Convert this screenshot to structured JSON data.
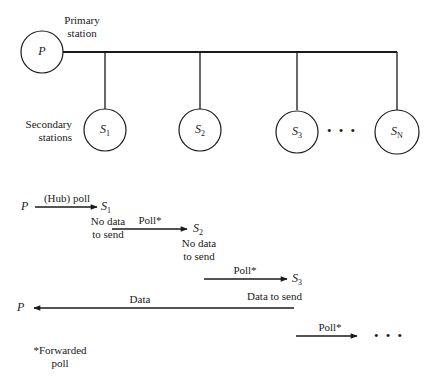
{
  "topology": {
    "primary": {
      "label": "P",
      "caption_line1": "Primary",
      "caption_line2": "station"
    },
    "secondary_caption_line1": "Secondary",
    "secondary_caption_line2": "stations",
    "secondaries": [
      {
        "base": "S",
        "sub": "1"
      },
      {
        "base": "S",
        "sub": "2"
      },
      {
        "base": "S",
        "sub": "3"
      },
      {
        "base": "S",
        "sub": "N"
      }
    ],
    "ellipsis": "• • •"
  },
  "sequence": {
    "step1": {
      "from": "P",
      "label": "(Hub) poll",
      "to_base": "S",
      "to_sub": "1",
      "note_line1": "No data",
      "note_line2": "to send"
    },
    "step2": {
      "label": "Poll*",
      "to_base": "S",
      "to_sub": "2",
      "note_line1": "No data",
      "note_line2": "to send"
    },
    "step3": {
      "label": "Poll*",
      "to_base": "S",
      "to_sub": "3",
      "note": "Data to send"
    },
    "step4": {
      "label": "Data",
      "to": "P"
    },
    "step5": {
      "label": "Poll*",
      "ellipsis": "• • •"
    }
  },
  "footnote": {
    "line1": "*Forwarded",
    "line2": "poll"
  },
  "colors": {
    "stroke": "#1a1a1a",
    "background": "#ffffff"
  }
}
